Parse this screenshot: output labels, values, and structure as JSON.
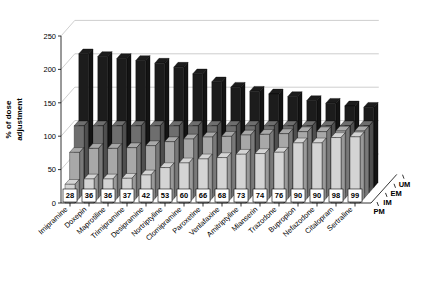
{
  "chart_data": {
    "type": "bar",
    "title": "",
    "xlabel": "",
    "ylabel": "% of dose adjustment",
    "zlabel": "",
    "ylim": [
      0,
      250
    ],
    "yticks": [
      0,
      50,
      100,
      150,
      200,
      250
    ],
    "grid": true,
    "legend_position": "none",
    "depth_categories": [
      "PM",
      "IM",
      "EM",
      "UM"
    ],
    "categories": [
      "Imipramine",
      "Doxepin",
      "Maprotiline",
      "Trimipramine",
      "Desipramine",
      "Nortriptyline",
      "Clomipramine",
      "Paroxetine",
      "Venlafaxine",
      "Amitriptyline",
      "Mianserin",
      "Trazodone",
      "Bupropion",
      "Nefazodone",
      "Citalopram",
      "Sertraline"
    ],
    "data_labels": [
      28,
      36,
      36,
      37,
      42,
      53,
      60,
      66,
      68,
      73,
      74,
      76,
      90,
      90,
      98,
      99
    ],
    "series": [
      {
        "name": "PM",
        "values": [
          28,
          36,
          36,
          37,
          42,
          53,
          60,
          66,
          68,
          73,
          74,
          76,
          90,
          90,
          98,
          99
        ]
      },
      {
        "name": "IM",
        "values": [
          68,
          74,
          74,
          75,
          78,
          84,
          88,
          91,
          92,
          94,
          95,
          96,
          99,
          99,
          100,
          100
        ]
      },
      {
        "name": "EM",
        "values": [
          100,
          100,
          100,
          100,
          100,
          100,
          100,
          100,
          100,
          100,
          100,
          100,
          100,
          100,
          100,
          100
        ]
      },
      {
        "name": "UM",
        "values": [
          200,
          196,
          193,
          190,
          186,
          180,
          170,
          158,
          150,
          144,
          140,
          136,
          130,
          126,
          122,
          120
        ]
      }
    ],
    "series_colors": [
      "#d4d4d4",
      "#a8a8a8",
      "#6e6e6e",
      "#1c1c1c"
    ]
  }
}
